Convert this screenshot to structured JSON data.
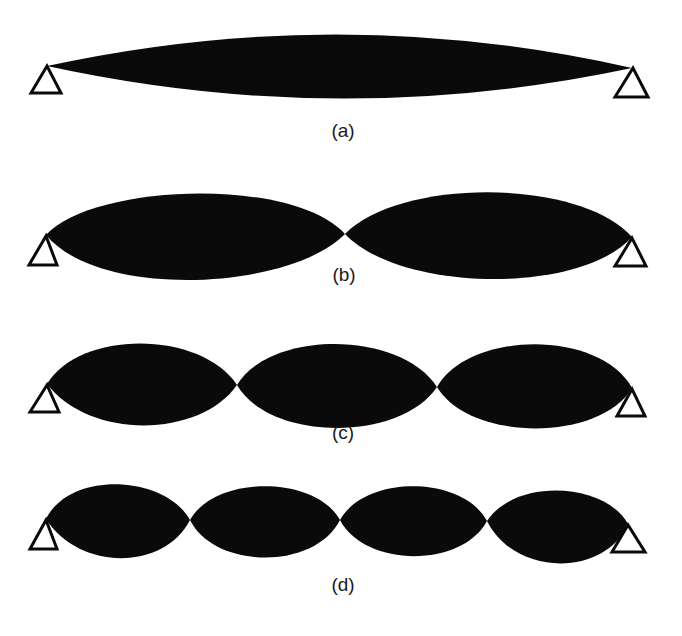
{
  "figure": {
    "colors": {
      "fill": "#0a0a0a",
      "background": "#ffffff"
    },
    "panels": [
      {
        "label": "(a)",
        "mode": 1,
        "lobes": 1
      },
      {
        "label": "(b)",
        "mode": 2,
        "lobes": 2
      },
      {
        "label": "(c)",
        "mode": 3,
        "lobes": 3
      },
      {
        "label": "(d)",
        "mode": 4,
        "lobes": 4
      }
    ],
    "support_icon": "pin-support-triangle-icon"
  }
}
